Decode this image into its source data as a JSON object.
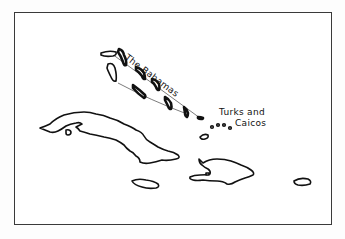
{
  "map": {
    "title": "Caribbean islands sketch map",
    "labels": {
      "bahamas": "The Bahamas",
      "turks_line1": "Turks and",
      "turks_line2": "Caicos"
    },
    "features": [
      {
        "name": "Cuba",
        "labeled": false
      },
      {
        "name": "Isle of Youth",
        "labeled": false
      },
      {
        "name": "The Bahamas",
        "labeled": true
      },
      {
        "name": "Turks and Caicos",
        "labeled": true
      },
      {
        "name": "Hispaniola",
        "labeled": false
      },
      {
        "name": "Jamaica",
        "labeled": false
      },
      {
        "name": "Puerto Rico",
        "labeled": false
      },
      {
        "name": "Great Inagua",
        "labeled": false
      }
    ],
    "colors": {
      "line": "#111111",
      "frame": "#3a3a3a",
      "background": "#ffffff"
    }
  }
}
